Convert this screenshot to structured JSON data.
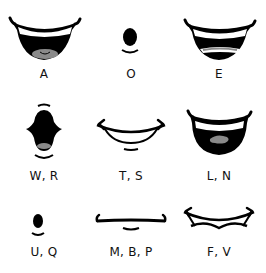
{
  "colors": {
    "ink": "#000000",
    "teeth": "#ffffff",
    "tongue": "#8a8a8a",
    "background": "#ffffff"
  },
  "mouths": [
    {
      "label": "A",
      "shape": "wide-open-smile-tongue"
    },
    {
      "label": "O",
      "shape": "small-round-oval"
    },
    {
      "label": "E",
      "shape": "wide-open-smile-teeth"
    },
    {
      "label": "W, R",
      "shape": "puckered-open"
    },
    {
      "label": "T, S",
      "shape": "closed-teeth-smile"
    },
    {
      "label": "L, N",
      "shape": "open-smile-tongue-up"
    },
    {
      "label": "U, Q",
      "shape": "tiny-oval"
    },
    {
      "label": "M, B, P",
      "shape": "closed-line"
    },
    {
      "label": "F, V",
      "shape": "teeth-on-lip"
    }
  ]
}
